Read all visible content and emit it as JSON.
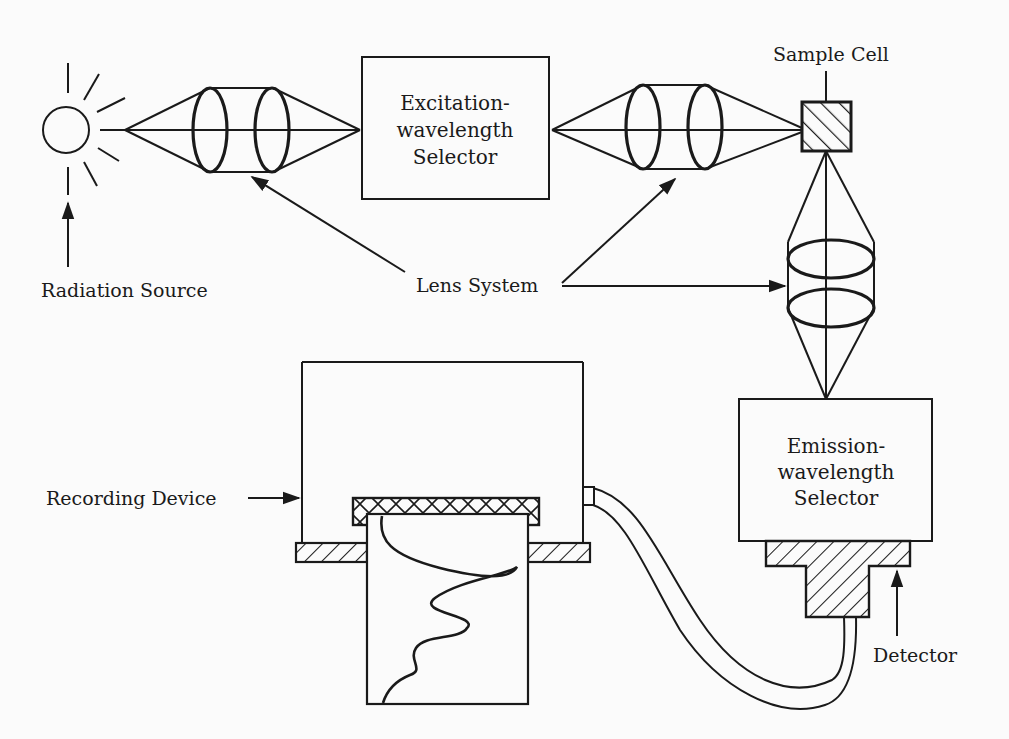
{
  "diagram": {
    "colors": {
      "ink": "#1a1a1a",
      "background": "#fbfbfb"
    },
    "labels": {
      "radiation_source": "Radiation Source",
      "lens_system": "Lens System",
      "sample_cell": "Sample Cell",
      "recording_device": "Recording Device",
      "detector": "Detector"
    },
    "boxes": {
      "excitation": {
        "line1": "Excitation-",
        "line2": "wavelength",
        "line3": "Selector"
      },
      "emission": {
        "line1": "Emission-",
        "line2": "wavelength",
        "line3": "Selector"
      }
    },
    "components": [
      "radiation-source",
      "lens-system-1",
      "excitation-wavelength-selector",
      "lens-system-2",
      "sample-cell",
      "lens-system-3",
      "emission-wavelength-selector",
      "detector",
      "cable",
      "recording-device"
    ]
  }
}
